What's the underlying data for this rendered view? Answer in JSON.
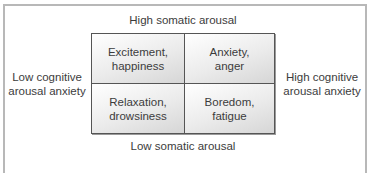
{
  "diagram": {
    "axes": {
      "top": "High somatic arousal",
      "bottom": "Low somatic arousal",
      "left": "Low cognitive\narousal anxiety",
      "right": "High cognitive\narousal anxiety"
    },
    "quadrants": {
      "top_left": "Excitement,\nhappiness",
      "top_right": "Anxiety,\nanger",
      "bottom_left": "Relaxation,\ndrowsiness",
      "bottom_right": "Boredom,\nfatigue"
    },
    "colors": {
      "frame_border": "#b8b8b8",
      "grid_border": "#555555",
      "text": "#3c3c3c"
    }
  }
}
